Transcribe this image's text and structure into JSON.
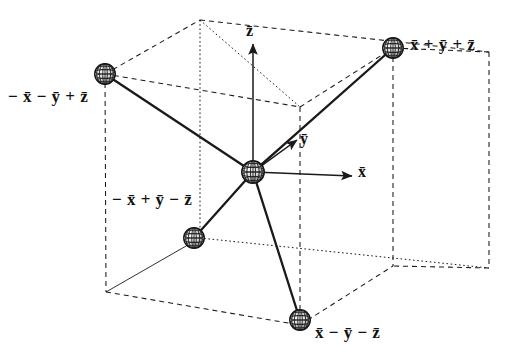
{
  "figure": {
    "kind": "tetrahedral-coordination-in-cube",
    "background_color": "#ffffff",
    "ink_color": "#1a1a1a",
    "description_title": "Tetrahedral bonding directions inside a cube"
  },
  "axes": [
    {
      "id": "z",
      "label": "z̄",
      "direction": "up",
      "tip": {
        "x": 253,
        "y": 44
      },
      "tail": {
        "x": 253,
        "y": 172
      },
      "label_pos": {
        "x": 246,
        "y": 22
      }
    },
    {
      "id": "y",
      "label": "ȳ",
      "direction": "upper-right",
      "tip": {
        "x": 297,
        "y": 140
      },
      "tail": {
        "x": 253,
        "y": 172
      },
      "label_pos": {
        "x": 300,
        "y": 130
      }
    },
    {
      "id": "x",
      "label": "x̄",
      "direction": "right",
      "tip": {
        "x": 352,
        "y": 176
      },
      "tail": {
        "x": 253,
        "y": 172
      },
      "label_pos": {
        "x": 358,
        "y": 163
      }
    }
  ],
  "central_atom": {
    "name": "central-atom",
    "pos": {
      "x": 253,
      "y": 172
    },
    "radius": 12
  },
  "ligands": [
    {
      "id": "ppp",
      "label": "x̄ + ȳ + z̄",
      "pos": {
        "x": 393,
        "y": 48
      },
      "radius": 11,
      "label_pos": {
        "x": 410,
        "y": 35
      },
      "label_align": "left"
    },
    {
      "id": "mmp",
      "label": "− x̄ − ȳ + z̄",
      "pos": {
        "x": 105,
        "y": 74
      },
      "radius": 11,
      "label_pos": {
        "x": 8,
        "y": 87
      },
      "label_align": "left"
    },
    {
      "id": "mpm",
      "label": "− x̄ + ȳ − z̄",
      "pos": {
        "x": 194,
        "y": 238
      },
      "radius": 11,
      "label_pos": {
        "x": 112,
        "y": 190
      },
      "label_align": "left"
    },
    {
      "id": "pmm",
      "label": "x̄ − ȳ − z̄",
      "pos": {
        "x": 300,
        "y": 320
      },
      "radius": 11,
      "label_pos": {
        "x": 315,
        "y": 323
      },
      "label_align": "left"
    }
  ],
  "bonds": [
    {
      "from": "central-atom",
      "to": "ppp"
    },
    {
      "from": "central-atom",
      "to": "mmp"
    },
    {
      "from": "central-atom",
      "to": "mpm"
    },
    {
      "from": "central-atom",
      "to": "pmm"
    }
  ],
  "cube": {
    "style": "dashed-wireframe",
    "vertices": {
      "top_back_left": {
        "x": 200,
        "y": 20
      },
      "top_back_right": {
        "x": 489,
        "y": 52
      },
      "top_front_left": {
        "x": 105,
        "y": 74
      },
      "top_front_right": {
        "x": 393,
        "y": 48
      },
      "mid_top_inner": {
        "x": 300,
        "y": 107
      },
      "bot_back_left": {
        "x": 200,
        "y": 238
      },
      "bot_back_right": {
        "x": 489,
        "y": 268
      },
      "bot_front_left": {
        "x": 106,
        "y": 292
      },
      "bot_front_right": {
        "x": 393,
        "y": 266
      },
      "bot_inner": {
        "x": 300,
        "y": 325
      }
    }
  }
}
